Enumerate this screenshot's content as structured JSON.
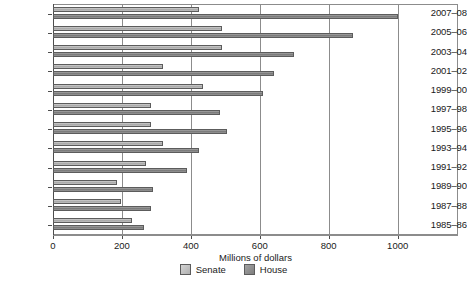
{
  "chart_data": {
    "type": "bar",
    "orientation": "horizontal",
    "title": "",
    "xlabel": "Millions of dollars",
    "ylabel": "",
    "xlim": [
      0,
      1175
    ],
    "xticks": [
      0,
      200,
      400,
      600,
      800,
      1000
    ],
    "xtick_labels": [
      "0",
      "200",
      "400",
      "600",
      "800",
      "1000"
    ],
    "grid": "vertical",
    "legend_position": "bottom-center",
    "categories": [
      "2007–08",
      "2005–06",
      "2003–04",
      "2001–02",
      "1999–00",
      "1997–98",
      "1995–96",
      "1993–94",
      "1991–92",
      "1989–90",
      "1987–88",
      "1985–86"
    ],
    "series": [
      {
        "name": "Senate",
        "color": "#bfbfbf",
        "values": [
          425,
          490,
          490,
          320,
          435,
          285,
          285,
          320,
          270,
          185,
          198,
          230
        ]
      },
      {
        "name": "House",
        "color": "#8c8c8c",
        "values": [
          1000,
          870,
          700,
          640,
          610,
          485,
          505,
          425,
          390,
          290,
          285,
          265
        ]
      }
    ]
  },
  "legend": {
    "items": [
      {
        "label": "Senate",
        "swatch": "senate"
      },
      {
        "label": "House",
        "swatch": "house"
      }
    ]
  }
}
